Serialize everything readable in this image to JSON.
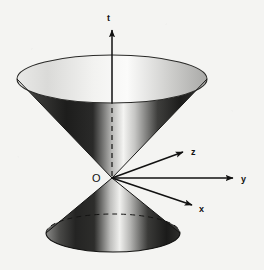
{
  "figure": {
    "background_color": "#f4f4f2",
    "ink_color": "#111111",
    "origin": {
      "label": "O",
      "x": 112,
      "y": 178
    },
    "axes": [
      {
        "name": "t",
        "label": "t",
        "direction": "vertical-up",
        "from": [
          112,
          178
        ],
        "to": [
          112,
          27
        ],
        "label_pos": [
          107,
          18
        ],
        "arrowhead": true,
        "style": "solid"
      },
      {
        "name": "z",
        "label": "z",
        "direction": "upper-right",
        "from": [
          112,
          178
        ],
        "to": [
          186,
          151
        ],
        "label_pos": [
          192,
          152
        ],
        "arrowhead": true,
        "style": "solid"
      },
      {
        "name": "y",
        "label": "y",
        "direction": "right",
        "from": [
          112,
          178
        ],
        "to": [
          236,
          178
        ],
        "label_pos": [
          242,
          181
        ],
        "arrowhead": true,
        "style": "solid"
      },
      {
        "name": "x",
        "label": "x",
        "direction": "lower-right",
        "from": [
          112,
          178
        ],
        "to": [
          196,
          206
        ],
        "label_pos": [
          201,
          210
        ],
        "arrowhead": true,
        "style": "solid"
      }
    ],
    "cones": [
      {
        "name": "future-light-cone",
        "position": "upper",
        "apex": [
          112,
          178
        ],
        "rim_center": [
          112,
          79
        ],
        "rim_rx": 95,
        "rim_ry": 24,
        "interior_visible": true,
        "hidden_axis_segment": "dashed"
      },
      {
        "name": "past-light-cone",
        "position": "lower",
        "apex": [
          112,
          178
        ],
        "rim_center": [
          113,
          233
        ],
        "rim_rx": 67,
        "rim_ry": 19,
        "interior_visible": false,
        "back_rim_style": "dashed"
      }
    ],
    "dashed_elements": [
      {
        "name": "t-axis-hidden-segment",
        "from": [
          112,
          103
        ],
        "to": [
          112,
          176
        ]
      },
      {
        "name": "lower-cone-back-rim",
        "description": "dashed back half of lower cone base ellipse"
      }
    ]
  }
}
